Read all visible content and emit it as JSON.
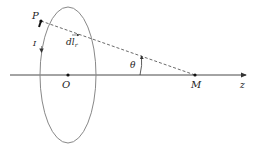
{
  "diagram": {
    "labels": {
      "P": "P",
      "O": "O",
      "M": "M",
      "z": "z",
      "theta": "θ",
      "I": "I",
      "dl_main": "dl",
      "dl_sub": "r"
    },
    "colors": {
      "loop": "#888888",
      "axis": "#333333",
      "dashed": "#444444",
      "text": "#222222"
    },
    "points": {
      "O": [
        68,
        75
      ],
      "M": [
        195,
        75
      ],
      "P": [
        40,
        21
      ]
    }
  }
}
